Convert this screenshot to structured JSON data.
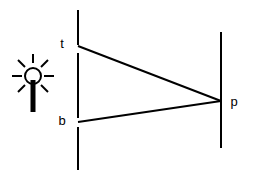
{
  "diagram": {
    "type": "optics-ray-diagram",
    "background_color": "#ffffff",
    "stroke_color": "#000000",
    "canvas": {
      "width": 255,
      "height": 182
    },
    "labels": {
      "top_label": "t",
      "bottom_label": "b",
      "point_label": "p"
    },
    "light_source": {
      "icon_name": "sun-light-icon",
      "circle_center_x": 33,
      "circle_center_y": 76,
      "circle_radius": 8,
      "ray_count": 7,
      "stem_top_y": 82,
      "stem_bottom_y": 112,
      "stem_width": 4
    },
    "object_line": {
      "name": "object-plane",
      "x": 78,
      "segments": [
        {
          "y1": 10,
          "y2": 45
        },
        {
          "y1": 53,
          "y2": 118
        },
        {
          "y1": 127,
          "y2": 170
        }
      ]
    },
    "image_line": {
      "name": "image-plane",
      "x": 221,
      "y1": 32,
      "y2": 148
    },
    "rays": [
      {
        "name": "top-ray",
        "x1": 78,
        "y1": 46,
        "x2": 221,
        "y2": 101
      },
      {
        "name": "bottom-ray",
        "x1": 78,
        "y1": 122,
        "x2": 221,
        "y2": 101
      }
    ],
    "label_positions": {
      "top": {
        "x": 62,
        "y": 45
      },
      "bottom": {
        "x": 62,
        "y": 122
      },
      "point": {
        "x": 234,
        "y": 102
      }
    }
  }
}
